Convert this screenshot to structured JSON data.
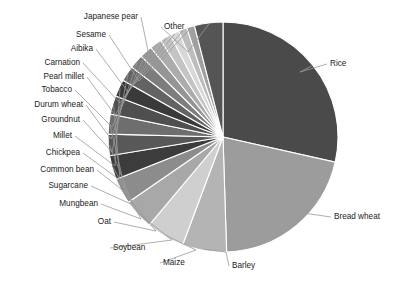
{
  "chart_data": {
    "type": "pie",
    "title": "",
    "subtitle": "",
    "xlabel": "",
    "ylabel": "",
    "legend_position": "none",
    "grid": false,
    "labels_outside": true,
    "start_angle_deg": 0,
    "direction": "clockwise",
    "categories": [
      "Rice",
      "Bread wheat",
      "Barley",
      "Maize",
      "Soybean",
      "Oat",
      "Mungbean",
      "Sugarcane",
      "Common bean",
      "Chickpea",
      "Millet",
      "Groundnut",
      "Durum wheat",
      "Tobacco",
      "Pearl millet",
      "Carnation",
      "Aibika",
      "Sesame",
      "Japanese pear",
      "Other"
    ],
    "values": [
      28.5,
      21.0,
      6.2,
      5.4,
      4.3,
      3.6,
      3.4,
      3.0,
      2.8,
      2.6,
      2.4,
      2.2,
      2.0,
      1.8,
      1.7,
      1.5,
      1.3,
      1.2,
      1.1,
      4.0
    ],
    "colors": [
      "#4a4a4a",
      "#9c9c9c",
      "#b4b4b4",
      "#cfcfcf",
      "#a8a8a8",
      "#8c8c8c",
      "#3c3c3c",
      "#585858",
      "#6e6e6e",
      "#4f4f4f",
      "#3a3a3a",
      "#636363",
      "#7d7d7d",
      "#959595",
      "#acacac",
      "#c4c4c4",
      "#d8d8d8",
      "#bdbdbd",
      "#a0a0a0",
      "#555555"
    ],
    "slices": [
      {
        "label": "Rice",
        "value": 28.5,
        "color": "#4a4a4a"
      },
      {
        "label": "Bread wheat",
        "value": 21.0,
        "color": "#9c9c9c"
      },
      {
        "label": "Barley",
        "value": 6.2,
        "color": "#b4b4b4"
      },
      {
        "label": "Maize",
        "value": 5.4,
        "color": "#cfcfcf"
      },
      {
        "label": "Soybean",
        "value": 4.3,
        "color": "#a8a8a8"
      },
      {
        "label": "Oat",
        "value": 3.6,
        "color": "#8c8c8c"
      },
      {
        "label": "Mungbean",
        "value": 3.4,
        "color": "#3c3c3c"
      },
      {
        "label": "Sugarcane",
        "value": 3.0,
        "color": "#585858"
      },
      {
        "label": "Common bean",
        "value": 2.8,
        "color": "#6e6e6e"
      },
      {
        "label": "Chickpea",
        "value": 2.6,
        "color": "#4f4f4f"
      },
      {
        "label": "Millet",
        "value": 2.4,
        "color": "#3a3a3a"
      },
      {
        "label": "Groundnut",
        "value": 2.2,
        "color": "#636363"
      },
      {
        "label": "Durum wheat",
        "value": 2.0,
        "color": "#7d7d7d"
      },
      {
        "label": "Tobacco",
        "value": 1.8,
        "color": "#959595"
      },
      {
        "label": "Pearl millet",
        "value": 1.7,
        "color": "#acacac"
      },
      {
        "label": "Carnation",
        "value": 1.5,
        "color": "#c4c4c4"
      },
      {
        "label": "Aibika",
        "value": 1.3,
        "color": "#d8d8d8"
      },
      {
        "label": "Sesame",
        "value": 1.2,
        "color": "#bdbdbd"
      },
      {
        "label": "Japanese pear",
        "value": 1.1,
        "color": "#a0a0a0"
      },
      {
        "label": "Other",
        "value": 4.0,
        "color": "#555555"
      }
    ]
  },
  "labels": {
    "rice": "Rice",
    "bread_wheat": "Bread wheat",
    "barley": "Barley",
    "maize": "Maize",
    "soybean": "Soybean",
    "oat": "Oat",
    "mungbean": "Mungbean",
    "sugarcane": "Sugarcane",
    "common_bean": "Common bean",
    "chickpea": "Chickpea",
    "millet": "Millet",
    "groundnut": "Groundnut",
    "durum_wheat": "Durum wheat",
    "tobacco": "Tobacco",
    "pearl_millet": "Pearl millet",
    "carnation": "Carnation",
    "aibika": "Aibika",
    "sesame": "Sesame",
    "japanese_pear": "Japanese pear",
    "other": "Other"
  },
  "geometry": {
    "center_x": 223,
    "center_y": 137,
    "radius": 115
  }
}
